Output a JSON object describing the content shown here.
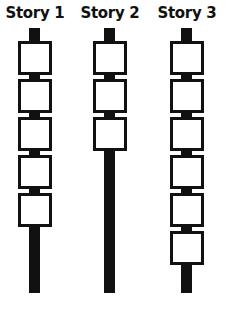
{
  "diagram": {
    "stories": [
      {
        "label": "Story 1",
        "boxes": 5,
        "center_x": 35
      },
      {
        "label": "Story 2",
        "boxes": 3,
        "center_x": 110
      },
      {
        "label": "Story 3",
        "boxes": 6,
        "center_x": 187
      }
    ],
    "colors": {
      "line": "#111111",
      "box_fill": "#ffffff",
      "background": "#ffffff"
    }
  }
}
